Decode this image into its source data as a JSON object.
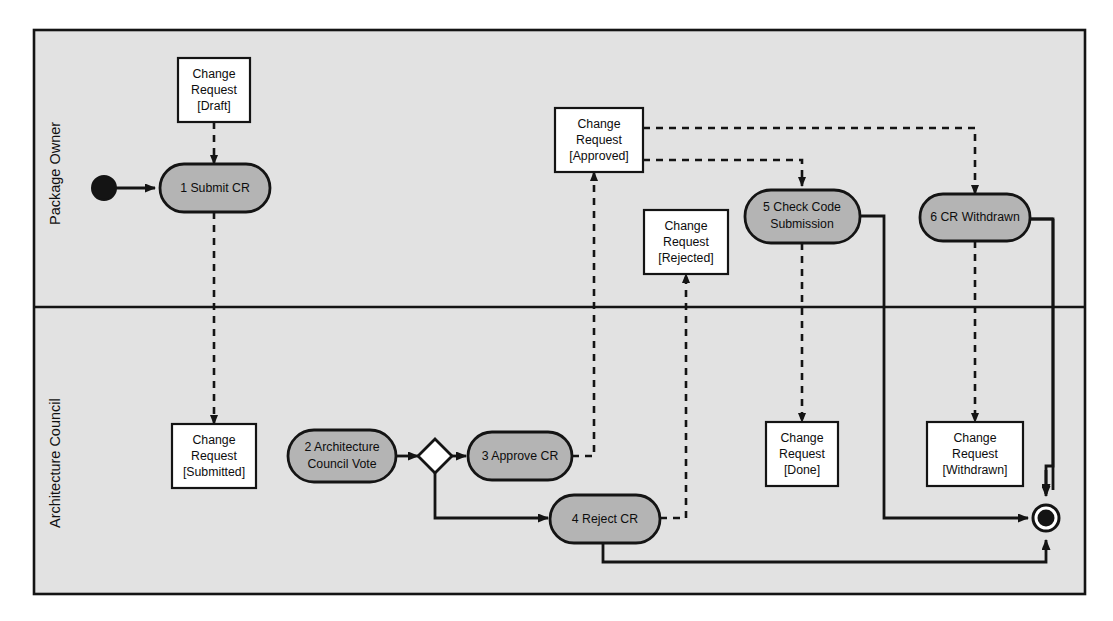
{
  "diagram": {
    "type": "uml-activity-diagram",
    "background_color": "#ffffff",
    "lane_fill": "#e2e2e2",
    "activity_fill": "#b4b4b4",
    "object_fill": "#ffffff",
    "stroke_color": "#141414"
  },
  "lanes": [
    {
      "id": "lane-package-owner",
      "label": "Package Owner"
    },
    {
      "id": "lane-architecture-council",
      "label": "Architecture Council"
    }
  ],
  "nodes": {
    "start": {
      "name": "initial-node",
      "label": ""
    },
    "end": {
      "name": "final-node",
      "label": ""
    },
    "decision": {
      "name": "decision-diamond",
      "label": ""
    },
    "activity1": {
      "label_line1": "1 Submit CR",
      "label_line2": ""
    },
    "activity2": {
      "label_line1": "2 Architecture",
      "label_line2": "Council Vote"
    },
    "activity3": {
      "label_line1": "3 Approve CR",
      "label_line2": ""
    },
    "activity4": {
      "label_line1": "4 Reject CR",
      "label_line2": ""
    },
    "activity5": {
      "label_line1": "5 Check Code",
      "label_line2": "Submission"
    },
    "activity6": {
      "label_line1": "6 CR Withdrawn",
      "label_line2": ""
    }
  },
  "objects": {
    "draft": {
      "line1": "Change",
      "line2": "Request",
      "line3": "[Draft]"
    },
    "submitted": {
      "line1": "Change",
      "line2": "Request",
      "line3": "[Submitted]"
    },
    "approved": {
      "line1": "Change",
      "line2": "Request",
      "line3": "[Approved]"
    },
    "rejected": {
      "line1": "Change",
      "line2": "Request",
      "line3": "[Rejected]"
    },
    "done": {
      "line1": "Change",
      "line2": "Request",
      "line3": "[Done]"
    },
    "withdrawn": {
      "line1": "Change",
      "line2": "Request",
      "line3": "[Withdrawn]"
    }
  }
}
